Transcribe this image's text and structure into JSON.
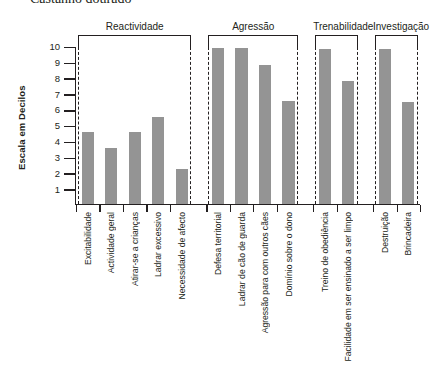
{
  "page_title": "Castanho dourado",
  "chart_data": {
    "type": "bar",
    "title": "Castanho dourado",
    "xlabel": "",
    "ylabel": "Escala em Decilos",
    "ylim": [
      0,
      10
    ],
    "ytick_labels": [
      "1",
      "2",
      "3",
      "4",
      "5",
      "6",
      "7",
      "8",
      "9",
      "10"
    ],
    "yticks": [
      1,
      2,
      3,
      4,
      5,
      6,
      7,
      8,
      9,
      10
    ],
    "grid": false,
    "legend": "none",
    "bar_color": "#949494",
    "axis_color": "#231f20",
    "groups": [
      {
        "name": "Reactividade",
        "categories": [
          "Excitabilidade",
          "Actividade geral",
          "Atirar-se a crianças",
          "Ladrar  excessivo",
          "Necessidade de afecto"
        ],
        "values": [
          4.65,
          3.65,
          4.65,
          5.6,
          2.35
        ]
      },
      {
        "name": "Agressão",
        "categories": [
          "Defesa territorial",
          "Ladrar de cão de guarda",
          "Agressão para com outros cães",
          "Domínio sobre o dono"
        ],
        "values": [
          10,
          10,
          8.9,
          6.6
        ]
      },
      {
        "name": "Trenabilidade",
        "categories": [
          "Treino de obediência",
          "Facilidade em ser ensinado a ser limpo"
        ],
        "values": [
          9.9,
          7.9
        ]
      },
      {
        "name": "Investigação",
        "categories": [
          "Destruição",
          "Brincadeira"
        ],
        "values": [
          9.9,
          6.55
        ]
      }
    ]
  }
}
